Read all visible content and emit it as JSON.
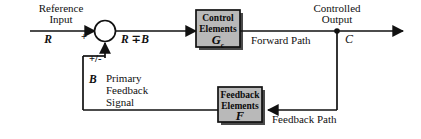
{
  "diagram": {
    "colors": {
      "line": "#111111",
      "block_fill": "#b9b9b9",
      "block_border": "#111111",
      "background": "#ffffff",
      "text": "#101010"
    },
    "labels": {
      "reference_input_line1": "Reference",
      "reference_input_line2": "Input",
      "reference_symbol": "R",
      "plus_sign": "+",
      "error_symbol": "R ∓B",
      "plus_minus": "+/-",
      "feedback_symbol": "B",
      "primary_feedback_line1": "Primary",
      "primary_feedback_line2": "Feedback",
      "primary_feedback_line3": "Signal",
      "forward_path": "Forward Path",
      "feedback_path": "Feedback Path",
      "controlled_output_line1": "Controlled",
      "controlled_output_line2": "Output",
      "output_symbol": "C"
    },
    "blocks": [
      {
        "id": "control-elements",
        "text_line1": "Control",
        "text_line2": "Elements",
        "symbol": "G",
        "symbol_subscript": "c"
      },
      {
        "id": "feedback-elements",
        "text_line1": "Feedback",
        "text_line2": "Elements",
        "symbol": "F",
        "symbol_subscript": ""
      }
    ],
    "summing_junction": {
      "name": "summing-junction",
      "shape": "circle"
    },
    "takeoff_point": {
      "name": "takeoff-point",
      "shape": "dot"
    }
  }
}
